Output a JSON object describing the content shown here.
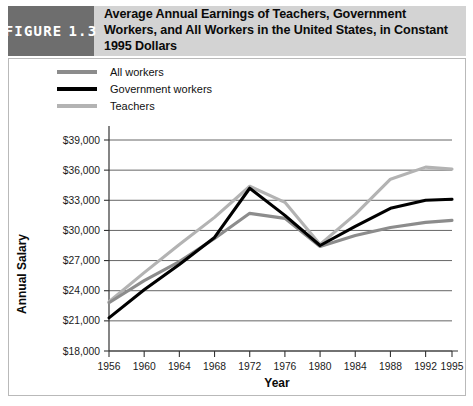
{
  "figure": {
    "tag_word": "FIGURE",
    "tag_number": "1.3",
    "title": "Average Annual Earnings of Teachers, Government Workers, and All Workers in the United States, in Constant 1995 Dollars"
  },
  "colors": {
    "all_workers": "#8c8c8c",
    "government_workers": "#000000",
    "teachers": "#b3b3b3",
    "header_band": "#d3d3d3",
    "figure_tag_box": "#6e6e6e",
    "gridline": "#555555",
    "axis": "#333333"
  },
  "legend": {
    "position": "top-left",
    "items": [
      {
        "label": "All workers",
        "color": "#8c8c8c"
      },
      {
        "label": "Government workers",
        "color": "#000000"
      },
      {
        "label": "Teachers",
        "color": "#b3b3b3"
      }
    ]
  },
  "chart_data": {
    "type": "line",
    "title": "Average Annual Earnings of Teachers, Government Workers, and All Workers in the United States, in Constant 1995 Dollars",
    "xlabel": "Year",
    "ylabel": "Annual Salary",
    "categories": [
      "1956",
      "1960",
      "1964",
      "1968",
      "1972",
      "1976",
      "1980",
      "1984",
      "1988",
      "1992",
      "1995"
    ],
    "x": [
      1956,
      1960,
      1964,
      1968,
      1972,
      1976,
      1980,
      1984,
      1988,
      1992,
      1995
    ],
    "ylim": [
      18000,
      39000
    ],
    "yticks": [
      18000,
      21000,
      24000,
      27000,
      30000,
      33000,
      36000,
      39000
    ],
    "ytick_labels": [
      "$18,000",
      "$21,000",
      "$24,000",
      "$27,000",
      "$30,000",
      "$33,000",
      "$36,000",
      "$39,000"
    ],
    "grid": true,
    "legend_position": "top-left",
    "series": [
      {
        "name": "All workers",
        "color": "#8c8c8c",
        "values": [
          22800,
          25000,
          26900,
          29200,
          31700,
          31200,
          28400,
          29500,
          30300,
          30800,
          31000
        ]
      },
      {
        "name": "Government workers",
        "color": "#000000",
        "values": [
          21300,
          24100,
          26600,
          29300,
          34200,
          31500,
          28500,
          30400,
          32200,
          33000,
          33100
        ]
      },
      {
        "name": "Teachers",
        "color": "#b3b3b3",
        "values": [
          22900,
          25800,
          28600,
          31300,
          34400,
          32800,
          28600,
          31600,
          35100,
          36300,
          36100
        ]
      }
    ]
  }
}
